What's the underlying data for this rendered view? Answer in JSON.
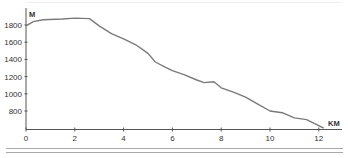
{
  "chart_data": {
    "type": "line",
    "title": "",
    "xlabel": "KM",
    "ylabel": "M",
    "xlim": [
      0,
      13
    ],
    "ylim": [
      600,
      1950
    ],
    "x_ticks": [
      0,
      2,
      4,
      6,
      8,
      10,
      12
    ],
    "y_ticks": [
      800,
      1000,
      1200,
      1400,
      1600,
      1800
    ],
    "grid": false,
    "legend": null,
    "series": [
      {
        "name": "Elevation profile",
        "color": "#7a7a7a",
        "x": [
          0,
          0.3,
          0.7,
          1.5,
          2.0,
          2.6,
          3.0,
          3.5,
          4.0,
          4.5,
          5.0,
          5.3,
          5.7,
          6.0,
          6.5,
          7.0,
          7.3,
          7.7,
          8.0,
          8.5,
          9.0,
          9.5,
          10.0,
          10.5,
          11.0,
          11.5,
          12.0,
          12.2
        ],
        "values": [
          1790,
          1840,
          1860,
          1870,
          1880,
          1875,
          1790,
          1700,
          1640,
          1570,
          1470,
          1370,
          1310,
          1270,
          1220,
          1160,
          1130,
          1140,
          1070,
          1020,
          960,
          880,
          800,
          780,
          720,
          700,
          630,
          600
        ]
      }
    ]
  },
  "axes": {
    "y_unit": "M",
    "x_unit": "KM",
    "y_tick_labels": [
      "1800",
      "1600",
      "1400",
      "1200",
      "1000",
      "800"
    ],
    "x_tick_labels": [
      "0",
      "2",
      "4",
      "6",
      "8",
      "10",
      "12"
    ]
  },
  "colors": {
    "line": "#7a7a7a",
    "axis": "#555555",
    "footer_rule": "#a8a8a8",
    "top_rule": "#eeeeee"
  }
}
